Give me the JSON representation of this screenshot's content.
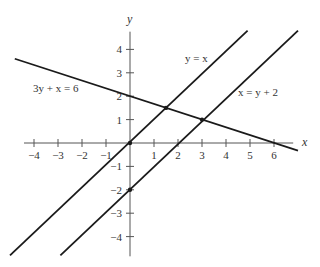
{
  "chart_data": {
    "type": "line",
    "title": "",
    "xlabel": "x",
    "ylabel": "y",
    "xlim": [
      -4.5,
      6.8
    ],
    "ylim": [
      -4.8,
      4.8
    ],
    "grid": false,
    "legend": "none (inline equation labels)",
    "x_ticks": [
      -4,
      -3,
      -2,
      -1,
      1,
      2,
      3,
      4,
      5,
      6
    ],
    "x_tick_labels": [
      "−4",
      "−3",
      "−2",
      "−1",
      "1",
      "2",
      "3",
      "4",
      "5",
      "6"
    ],
    "y_ticks": [
      4,
      3,
      2,
      1,
      -1,
      -2,
      -3,
      -4
    ],
    "y_tick_labels": [
      "4",
      "3",
      "2",
      "1",
      "−1",
      "−2",
      "−3",
      "−4"
    ],
    "series": [
      {
        "name": "3y + x = 6",
        "equation": "y = 2 - x/3",
        "x": [
          -4.8,
          7.0
        ],
        "y": [
          3.6,
          -0.33
        ]
      },
      {
        "name": "y = x",
        "equation": "y = x",
        "x": [
          -5.0,
          4.9
        ],
        "y": [
          -4.8,
          4.8
        ]
      },
      {
        "name": "x = y + 2",
        "equation": "y = x - 2",
        "x": [
          -2.9,
          7.0
        ],
        "y": [
          -4.8,
          4.8
        ]
      }
    ],
    "points": [
      {
        "label": "origin",
        "x": 0,
        "y": 0
      },
      {
        "label": "y-intercept of x = y + 2",
        "x": 0,
        "y": -2
      },
      {
        "label": "intersection of 3y + x = 6 and y = x",
        "x": 1.5,
        "y": 1.5
      },
      {
        "label": "intersection of 3y + x = 6 and x = y + 2",
        "x": 3,
        "y": 1
      }
    ],
    "annotations": [
      {
        "text": "3y + x = 6",
        "near_x": -3.2,
        "near_y": 2.5
      },
      {
        "text": "y = x",
        "near_x": 2.0,
        "near_y": 3.3
      },
      {
        "text": "x = y + 2",
        "near_x": 4.7,
        "near_y": 2.0
      }
    ]
  },
  "labels": {
    "x_axis": "x",
    "y_axis": "y",
    "eq1": "3y + x = 6",
    "eq2": "y = x",
    "eq3": "x = y + 2"
  },
  "colors": {
    "line": "#1a1a1a",
    "axis": "#555555",
    "text": "#333333"
  }
}
